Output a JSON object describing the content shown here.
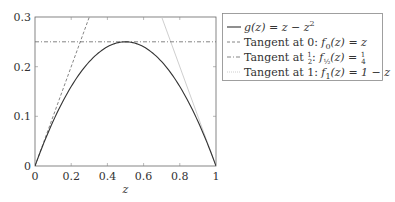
{
  "chart_data": {
    "type": "line",
    "title": "",
    "xlabel": "z",
    "ylabel": "",
    "xlim": [
      0,
      1
    ],
    "ylim": [
      0,
      0.3
    ],
    "grid": false,
    "legend_position": "outside-right-top",
    "x_ticks": [
      "0",
      "0.2",
      "0.4",
      "0.6",
      "0.8",
      "1"
    ],
    "y_ticks": [
      "0",
      "0.1",
      "0.2",
      "0.3"
    ],
    "series": [
      {
        "name": "g(z) = z − z²",
        "style": "solid",
        "color": "#333333",
        "x": [
          0,
          0.1,
          0.2,
          0.3,
          0.4,
          0.5,
          0.6,
          0.7,
          0.8,
          0.9,
          1.0
        ],
        "values": [
          0,
          0.09,
          0.16,
          0.21,
          0.24,
          0.25,
          0.24,
          0.21,
          0.16,
          0.09,
          0
        ]
      },
      {
        "name": "Tangent at 0: f₀(z) = z",
        "style": "dashed",
        "color": "#555555",
        "x": [
          0,
          0.3
        ],
        "values": [
          0,
          0.3
        ]
      },
      {
        "name": "Tangent at ½: f½(z) = ¼",
        "style": "dash-dot",
        "color": "#555555",
        "x": [
          0,
          1
        ],
        "values": [
          0.25,
          0.25
        ]
      },
      {
        "name": "Tangent at 1: f₁(z) = 1 − z",
        "style": "dotted",
        "color": "#bbbbbb",
        "x": [
          0.7,
          1
        ],
        "values": [
          0.3,
          0
        ]
      }
    ]
  },
  "legend": {
    "entries": [
      {
        "prefix": "",
        "func": "g(z) = z − z",
        "sup": "2",
        "suffix": ""
      },
      {
        "prefix": "Tangent at 0: ",
        "func": "f",
        "sub": "0",
        "suffix": "(z) = z"
      },
      {
        "prefix": "Tangent at ",
        "frac_top": "1",
        "frac_bot": "2",
        "mid": ": ",
        "func": "f",
        "sub": "½",
        "suffix": "(z) = ",
        "frac2_top": "1",
        "frac2_bot": "4"
      },
      {
        "prefix": "Tangent at 1: ",
        "func": "f",
        "sub": "1",
        "suffix": "(z) = 1 − z"
      }
    ]
  },
  "axes": {
    "x_ticks": [
      "0",
      "0.2",
      "0.4",
      "0.6",
      "0.8",
      "1"
    ],
    "y_ticks": [
      "0",
      "0.1",
      "0.2",
      "0.3"
    ],
    "xlabel": "z"
  }
}
